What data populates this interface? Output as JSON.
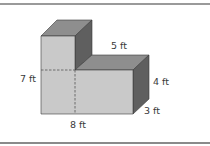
{
  "diagram": {
    "type": "composite rectangular prism",
    "colors": {
      "front_face": "#c9c9c9",
      "top_face": "#8e8e8e",
      "side_face": "#5f5f5f",
      "edge": "#3a3a3a",
      "dashed": "#555555"
    },
    "labels": {
      "top_width": "5 ft",
      "total_height": "7 ft",
      "right_height": "4 ft",
      "depth": "3 ft",
      "total_width": "8 ft"
    }
  }
}
